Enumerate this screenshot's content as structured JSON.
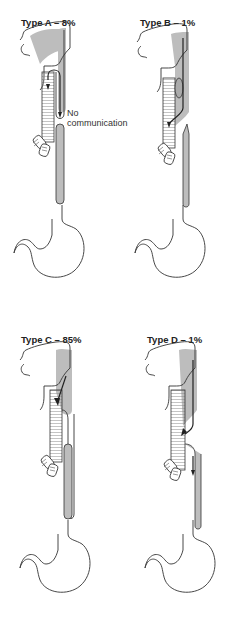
{
  "figure": {
    "panels": [
      {
        "id": "A",
        "title": "Type A – 8%",
        "annotation": "No communication"
      },
      {
        "id": "B",
        "title": "Type B – 1%"
      },
      {
        "id": "C",
        "title": "Type C – 85%"
      },
      {
        "id": "D",
        "title": "Type D – 1%"
      }
    ],
    "annotation_lines": [
      "No",
      "communication"
    ],
    "colors": {
      "shade": "#bdbdbd",
      "line": "#333333",
      "background": "#ffffff"
    }
  }
}
